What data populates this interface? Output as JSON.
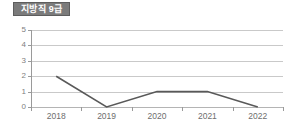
{
  "title": {
    "label": "지방직 9급",
    "badge_bg": "#7b7b7b",
    "badge_border": "#5d5d5d",
    "badge_text_color": "#ffffff"
  },
  "colors": {
    "line": "#595959",
    "gridline": "#c9c9c9",
    "baseline": "#b4b4b4",
    "axis": "#9a9a9a",
    "tick_label": "#6e6e6e",
    "y_label": "#808080",
    "background": "#ffffff"
  },
  "chart_data": {
    "type": "line",
    "title": "지방직 9급",
    "xlabel": "",
    "ylabel": "",
    "categories": [
      "2018",
      "2019",
      "2020",
      "2021",
      "2022"
    ],
    "values": [
      2,
      0,
      1,
      1,
      0
    ],
    "series": [
      {
        "name": "지방직 9급",
        "values": [
          2,
          0,
          1,
          1,
          0
        ]
      }
    ],
    "ylim": [
      0,
      5
    ],
    "yticks": [
      0,
      1,
      2,
      3,
      4,
      5
    ],
    "ytick_labels": [
      "0",
      "1",
      "2",
      "3",
      "4",
      "5"
    ],
    "grid": true,
    "grid_axis": "y",
    "legend": false,
    "legend_position": "none",
    "markers": false,
    "annotations": []
  }
}
